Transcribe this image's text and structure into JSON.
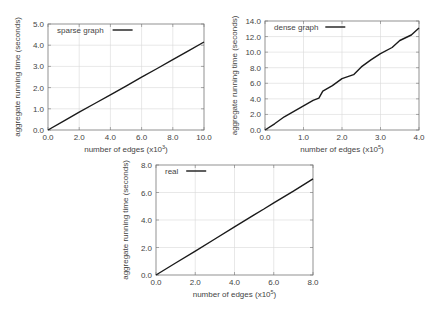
{
  "chart_data": [
    {
      "type": "line",
      "title": "",
      "legend": [
        "sparse graph"
      ],
      "legend_position": "top-left",
      "xlabel": "number of edges (x10",
      "xlabel_exp": "3",
      "ylabel": "aggregate running time (seconds)",
      "xlim": [
        0,
        10
      ],
      "ylim": [
        0,
        5
      ],
      "xticks": [
        "0.0",
        "2.0",
        "4.0",
        "6.0",
        "8.0",
        "10.0"
      ],
      "yticks": [
        "0.0",
        "1.0",
        "2.0",
        "3.0",
        "4.0",
        "5.0"
      ],
      "grid": true,
      "series": [
        {
          "name": "sparse graph",
          "x": [
            0,
            1,
            2,
            3,
            4,
            5,
            6,
            7,
            8,
            9,
            10
          ],
          "y": [
            0,
            0.42,
            0.84,
            1.25,
            1.66,
            2.07,
            2.49,
            2.9,
            3.32,
            3.73,
            4.15
          ]
        }
      ]
    },
    {
      "type": "line",
      "title": "",
      "legend": [
        "dense graph"
      ],
      "legend_position": "top-left",
      "xlabel": "number of edges (x10",
      "xlabel_exp": "5",
      "ylabel": "aggregate running time (seconds)",
      "xlim": [
        0,
        4
      ],
      "ylim": [
        0,
        14
      ],
      "xticks": [
        "0.0",
        "1.0",
        "2.0",
        "3.0",
        "4.0"
      ],
      "yticks": [
        "0.0",
        "2.0",
        "4.0",
        "6.0",
        "8.0",
        "10.0",
        "12.0",
        "14.0"
      ],
      "grid": true,
      "series": [
        {
          "name": "dense graph",
          "x": [
            0,
            0.25,
            0.5,
            0.75,
            1.0,
            1.25,
            1.4,
            1.5,
            1.75,
            2.0,
            2.3,
            2.5,
            2.75,
            3.0,
            3.3,
            3.5,
            3.8,
            4.0
          ],
          "y": [
            0,
            0.8,
            1.7,
            2.4,
            3.1,
            3.8,
            4.1,
            5.0,
            5.7,
            6.6,
            7.1,
            8.1,
            9.0,
            9.8,
            10.6,
            11.5,
            12.2,
            13.1
          ]
        }
      ]
    },
    {
      "type": "line",
      "title": "",
      "legend": [
        "real"
      ],
      "legend_position": "top-left",
      "xlabel": "number of edges (x10",
      "xlabel_exp": "5",
      "ylabel": "aggregate running time (seconds)",
      "xlim": [
        0,
        8
      ],
      "ylim": [
        0,
        8
      ],
      "xticks": [
        "0.0",
        "2.0",
        "4.0",
        "6.0",
        "8.0"
      ],
      "yticks": [
        "0.0",
        "2.0",
        "4.0",
        "6.0",
        "8.0"
      ],
      "grid": true,
      "series": [
        {
          "name": "real",
          "x": [
            0,
            1,
            2,
            3,
            4,
            5,
            5.5,
            6,
            7,
            8
          ],
          "y": [
            0,
            0.87,
            1.74,
            2.62,
            3.5,
            4.38,
            4.8,
            5.25,
            6.1,
            7.0
          ]
        }
      ]
    }
  ],
  "layout": [
    {
      "left": 48,
      "top": 24,
      "right": 204,
      "bottom": 130
    },
    {
      "left": 265,
      "top": 21,
      "right": 419,
      "bottom": 130
    },
    {
      "left": 156,
      "top": 165,
      "right": 313,
      "bottom": 275
    }
  ],
  "colors": {
    "line": "#1a1a1a",
    "grid": "#d8d8d8",
    "frame": "#777777",
    "text": "#444444"
  }
}
